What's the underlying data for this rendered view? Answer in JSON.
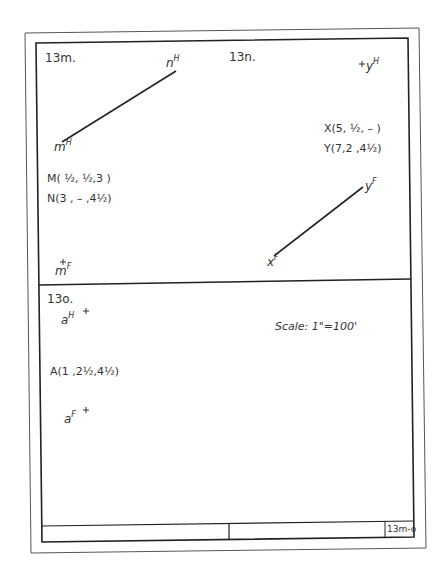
{
  "sheet": {
    "problems": [
      {
        "id": "13m",
        "label": "13m.",
        "points": [
          {
            "name": "m",
            "view": "H",
            "text": "m",
            "sup": "H"
          },
          {
            "name": "n",
            "view": "H",
            "text": "n",
            "sup": "H"
          },
          {
            "name": "m",
            "view": "F",
            "text": "m",
            "sup": "F",
            "marker": "+"
          }
        ],
        "coordinates": [
          "M( ½, ½,3 )",
          "N(3 , – ,4½)"
        ]
      },
      {
        "id": "13n",
        "label": "13n.",
        "points": [
          {
            "name": "y",
            "view": "H",
            "text": "y",
            "sup": "H",
            "marker": "+"
          },
          {
            "name": "y",
            "view": "F",
            "text": "y",
            "sup": "F"
          },
          {
            "name": "x",
            "view": "F",
            "text": "x",
            "sup": "F"
          }
        ],
        "coordinates": [
          "X(5, ½, – )",
          "Y(7,2 ,4½)"
        ]
      },
      {
        "id": "13o",
        "label": "13o.",
        "points": [
          {
            "name": "a",
            "view": "H",
            "text": "a",
            "sup": "H",
            "marker": "+"
          },
          {
            "name": "a",
            "view": "F",
            "text": "a",
            "sup": "F",
            "marker": "+"
          }
        ],
        "coordinates": [
          "A(1 ,2½,4½)"
        ],
        "scale": "Scale: 1\"=100'"
      }
    ],
    "title_block": {
      "sheet_id": "13m-o"
    }
  }
}
